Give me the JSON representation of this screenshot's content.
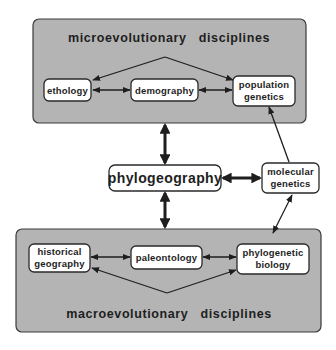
{
  "diagram": {
    "panels": {
      "micro": {
        "title": "microevolutionary   disciplines"
      },
      "macro": {
        "title": "macroevolutionary   disciplines"
      }
    },
    "nodes": {
      "ethology": {
        "label": "ethology"
      },
      "demography": {
        "label": "demography"
      },
      "population_genetics": {
        "line1": "population",
        "line2": "genetics"
      },
      "phylogeography": {
        "label": "phylogeography"
      },
      "molecular_genetics": {
        "line1": "molecular",
        "line2": "genetics"
      },
      "historical_geography": {
        "line1": "historical",
        "line2": "geography"
      },
      "paleontology": {
        "label": "paleontology"
      },
      "phylogenetic_biology": {
        "line1": "phylogenetic",
        "line2": "biology"
      }
    },
    "edges": [
      {
        "from": "ethology",
        "to": "demography",
        "type": "bidirectional"
      },
      {
        "from": "demography",
        "to": "population_genetics",
        "type": "bidirectional"
      },
      {
        "from": "micro-apex",
        "to": "ethology",
        "type": "directed"
      },
      {
        "from": "micro-apex",
        "to": "population_genetics",
        "type": "directed"
      },
      {
        "from": "micro-panel",
        "to": "phylogeography",
        "type": "bidirectional-thick"
      },
      {
        "from": "phylogeography",
        "to": "macro-panel",
        "type": "bidirectional-thick"
      },
      {
        "from": "phylogeography",
        "to": "molecular_genetics",
        "type": "bidirectional-thick"
      },
      {
        "from": "molecular_genetics",
        "to": "population_genetics",
        "type": "directed"
      },
      {
        "from": "molecular_genetics",
        "to": "phylogenetic_biology",
        "type": "directed"
      },
      {
        "from": "historical_geography",
        "to": "paleontology",
        "type": "bidirectional"
      },
      {
        "from": "paleontology",
        "to": "phylogenetic_biology",
        "type": "bidirectional"
      },
      {
        "from": "macro-apex",
        "to": "historical_geography",
        "type": "directed"
      },
      {
        "from": "macro-apex",
        "to": "phylogenetic_biology",
        "type": "directed"
      }
    ]
  }
}
